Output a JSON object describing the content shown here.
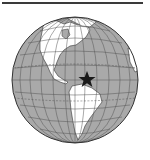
{
  "figure": {
    "marker": "star",
    "marker_location": "Caribbean / northern South America",
    "colors": {
      "ocean": "#a9a9a9",
      "land": "#ffffff",
      "grid": "#555555",
      "outline": "#333333",
      "marker": "#1a1a1a",
      "rule": "#3a3a3a"
    }
  }
}
